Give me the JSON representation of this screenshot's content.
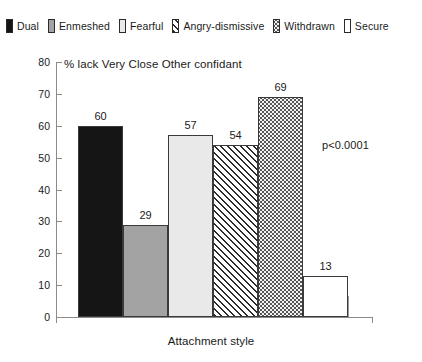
{
  "legend": {
    "entries": [
      {
        "label": "Dual",
        "fill": "solid-black",
        "color": "#151515"
      },
      {
        "label": "Enmeshed",
        "fill": "solid-gray",
        "color": "#a3a3a3"
      },
      {
        "label": "Fearful",
        "fill": "solid-light",
        "color": "#e9e9e9"
      },
      {
        "label": "Angry-dismissive",
        "fill": "diagonal",
        "color": "#ffffff"
      },
      {
        "label": "Withdrawn",
        "fill": "dotted",
        "color": "#565656"
      },
      {
        "label": "Secure",
        "fill": "white",
        "color": "#ffffff"
      }
    ]
  },
  "annotations": {
    "pvalue": "p<0.0001"
  },
  "axis": {
    "y_ticks": [
      "0",
      "10",
      "20",
      "30",
      "40",
      "50",
      "60",
      "70",
      "80"
    ],
    "x_label": "Attachment style"
  },
  "chart_data": {
    "type": "bar",
    "title": "% lack Very Close Other confidant",
    "xlabel": "Attachment style",
    "ylabel": "",
    "ylim": [
      0,
      80
    ],
    "ytick_step": 10,
    "grid": false,
    "legend_position": "top",
    "bar_gap": 0,
    "categories": [
      "Dual",
      "Enmeshed",
      "Fearful",
      "Angry-dismissive",
      "Withdrawn",
      "Secure"
    ],
    "values": [
      60,
      29,
      57,
      54,
      69,
      13
    ],
    "value_labels": [
      "60",
      "29",
      "57",
      "54",
      "69",
      "13"
    ],
    "fills": [
      "solid-black",
      "solid-gray",
      "solid-light",
      "diagonal",
      "dotted",
      "white"
    ],
    "annotation": "p<0.0001"
  }
}
